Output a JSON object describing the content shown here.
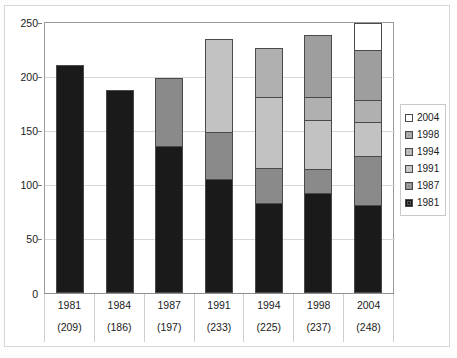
{
  "chart_data": {
    "type": "bar",
    "stacked": true,
    "title": "",
    "xlabel": "",
    "ylabel": "",
    "ylim": [
      0,
      250
    ],
    "yticks": [
      0,
      50,
      100,
      150,
      200,
      250
    ],
    "grid": true,
    "legend_position": "right",
    "categories": [
      "1981",
      "1984",
      "1987",
      "1991",
      "1994",
      "1998",
      "2004"
    ],
    "category_totals": [
      209,
      186,
      197,
      233,
      225,
      237,
      248
    ],
    "category_total_labels": [
      "(209)",
      "(186)",
      "(197)",
      "(233)",
      "(225)",
      "(237)",
      "(248)"
    ],
    "series": [
      {
        "name": "1981",
        "color": "#1a1a1a",
        "values": [
          209,
          186,
          135,
          105,
          82,
          92,
          81
        ]
      },
      {
        "name": "1987",
        "color": "#8a8a8a",
        "values": [
          0,
          0,
          62,
          43,
          33,
          22,
          45
        ]
      },
      {
        "name": "1991",
        "color": "#c2c2c2",
        "values": [
          0,
          0,
          0,
          85,
          66,
          45,
          31
        ]
      },
      {
        "name": "1994",
        "color": "#b0b0b0",
        "values": [
          0,
          0,
          0,
          0,
          44,
          22,
          21
        ]
      },
      {
        "name": "1998",
        "color": "#9e9e9e",
        "values": [
          0,
          0,
          0,
          0,
          0,
          56,
          46
        ]
      },
      {
        "name": "2004",
        "color": "#ffffff",
        "values": [
          0,
          0,
          0,
          0,
          0,
          0,
          24
        ]
      }
    ],
    "legend_order_top_to_bottom": [
      "2004",
      "1998",
      "1994",
      "1991",
      "1987",
      "1981"
    ]
  },
  "legend": {
    "items": [
      {
        "label": "2004",
        "color": "#ffffff"
      },
      {
        "label": "1998",
        "color": "#9e9e9e"
      },
      {
        "label": "1994",
        "color": "#b0b0b0"
      },
      {
        "label": "1991",
        "color": "#c2c2c2"
      },
      {
        "label": "1987",
        "color": "#8a8a8a"
      },
      {
        "label": "1981",
        "color": "#1a1a1a"
      }
    ]
  },
  "axis": {
    "y_tick_labels": [
      "250",
      "200",
      "150",
      "100",
      "50",
      "0"
    ],
    "zero_label": "0"
  }
}
